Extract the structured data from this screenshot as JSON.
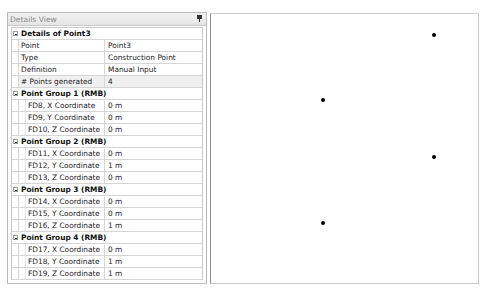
{
  "panel": {
    "title": "Details View",
    "pin_icon": "pin-icon",
    "sections": [
      {
        "label": "Details of Point3",
        "rows": [
          {
            "name": "Point",
            "value": "Point3"
          },
          {
            "name": "Type",
            "value": "Construction Point"
          },
          {
            "name": "Definition",
            "value": "Manual Input"
          },
          {
            "name": "# Points generated",
            "value": "4"
          }
        ]
      },
      {
        "label": "Point Group 1  (RMB)",
        "rows": [
          {
            "name": "FD8, X Coordinate",
            "value": "0 m"
          },
          {
            "name": "FD9, Y Coordinate",
            "value": "0 m"
          },
          {
            "name": "FD10, Z Coordinate",
            "value": "0 m"
          }
        ]
      },
      {
        "label": "Point Group 2  (RMB)",
        "rows": [
          {
            "name": "FD11, X Coordinate",
            "value": "0 m"
          },
          {
            "name": "FD12, Y Coordinate",
            "value": "1 m"
          },
          {
            "name": "FD13, Z Coordinate",
            "value": "0 m"
          }
        ]
      },
      {
        "label": "Point Group 3  (RMB)",
        "rows": [
          {
            "name": "FD14, X Coordinate",
            "value": "0 m"
          },
          {
            "name": "FD15, Y Coordinate",
            "value": "0 m"
          },
          {
            "name": "FD16, Z Coordinate",
            "value": "1 m"
          }
        ]
      },
      {
        "label": "Point Group 4  (RMB)",
        "rows": [
          {
            "name": "FD17, X Coordinate",
            "value": "0 m"
          },
          {
            "name": "FD18, Y Coordinate",
            "value": "1 m"
          },
          {
            "name": "FD19, Z Coordinate",
            "value": "1 m"
          }
        ]
      }
    ]
  },
  "viewport": {
    "points": [
      {
        "x": 434,
        "y": 35
      },
      {
        "x": 323,
        "y": 100
      },
      {
        "x": 434,
        "y": 157
      },
      {
        "x": 323,
        "y": 223
      }
    ],
    "point_color": "#000000"
  }
}
